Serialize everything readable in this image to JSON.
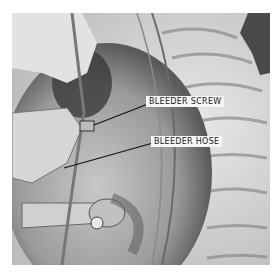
{
  "figure": {
    "callouts": [
      {
        "id": "bleeder-screw",
        "text": "BLEEDER SCREW"
      },
      {
        "id": "bleeder-hose",
        "text": "BLEEDER HOSE"
      }
    ]
  }
}
